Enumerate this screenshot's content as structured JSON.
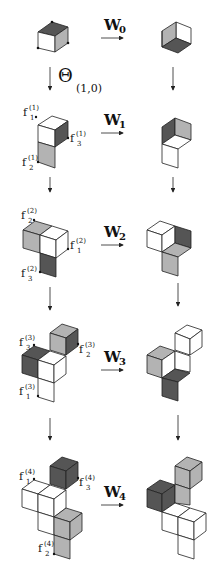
{
  "colors": {
    "dark": "#555555",
    "light": "#b3b3b3",
    "white": "#ffffff",
    "stroke": "#222222"
  },
  "theta": {
    "symbol": "Θ",
    "subscript": "(1,0)"
  },
  "rows": [
    {
      "w_label": "W",
      "w_sub": "0",
      "f_labels": []
    },
    {
      "w_label": "W",
      "w_sub": "1",
      "f_labels": [
        {
          "name": "f",
          "sup": "(1)",
          "sub": "1"
        },
        {
          "name": "f",
          "sup": "(1)",
          "sub": "3"
        },
        {
          "name": "f",
          "sup": "(1)",
          "sub": "2"
        }
      ]
    },
    {
      "w_label": "W",
      "w_sub": "2",
      "f_labels": [
        {
          "name": "f",
          "sup": "(2)",
          "sub": "2"
        },
        {
          "name": "f",
          "sup": "(2)",
          "sub": "1"
        },
        {
          "name": "f",
          "sup": "(2)",
          "sub": "3"
        }
      ]
    },
    {
      "w_label": "W",
      "w_sub": "3",
      "f_labels": [
        {
          "name": "f",
          "sup": "(3)",
          "sub": "3"
        },
        {
          "name": "f",
          "sup": "(3)",
          "sub": "2"
        },
        {
          "name": "f",
          "sup": "(3)",
          "sub": "1"
        }
      ]
    },
    {
      "w_label": "W",
      "w_sub": "4",
      "f_labels": [
        {
          "name": "f",
          "sup": "(4)",
          "sub": "1"
        },
        {
          "name": "f",
          "sup": "(4)",
          "sub": "3"
        },
        {
          "name": "f",
          "sup": "(4)",
          "sub": "2"
        }
      ]
    }
  ]
}
